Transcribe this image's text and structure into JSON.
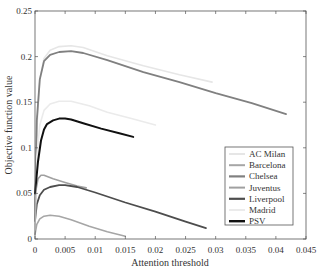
{
  "chart_data": {
    "type": "line",
    "title": "",
    "xlabel": "Attention threshold",
    "ylabel": "Objective function value",
    "xlim": [
      0,
      0.045
    ],
    "ylim": [
      0,
      0.25
    ],
    "xticks": [
      0,
      0.005,
      0.01,
      0.015,
      0.02,
      0.025,
      0.03,
      0.035,
      0.04,
      0.045
    ],
    "xtick_labels": [
      "0",
      "0.005",
      "0.01",
      "0.015",
      "0.02",
      "0.025",
      "0.03",
      "0.035",
      "0.04",
      "0.045"
    ],
    "yticks": [
      0,
      0.05,
      0.1,
      0.15,
      0.2,
      0.25
    ],
    "ytick_labels": [
      "0",
      "0.05",
      "0.1",
      "0.15",
      "0.2",
      "0.25"
    ],
    "grid": false,
    "legend_position": "lower right inside",
    "series": [
      {
        "name": "AC Milan",
        "color": "#e6e6e6",
        "width": 1.6,
        "x": [
          0,
          0.0003,
          0.0008,
          0.0015,
          0.0025,
          0.004,
          0.006,
          0.008,
          0.012,
          0.018,
          0.024,
          0.0294
        ],
        "y": [
          0.01,
          0.12,
          0.175,
          0.198,
          0.207,
          0.211,
          0.212,
          0.21,
          0.201,
          0.19,
          0.18,
          0.172
        ]
      },
      {
        "name": "Barcelona",
        "color": "#a6a6a6",
        "width": 1.6,
        "x": [
          0,
          0.0003,
          0.0008,
          0.0015,
          0.0025,
          0.004,
          0.006,
          0.009,
          0.012,
          0.015
        ],
        "y": [
          0.005,
          0.016,
          0.022,
          0.025,
          0.026,
          0.025,
          0.021,
          0.014,
          0.008,
          0.003
        ]
      },
      {
        "name": "Chelsea",
        "color": "#808080",
        "width": 1.8,
        "x": [
          0,
          0.0003,
          0.0008,
          0.0015,
          0.0025,
          0.004,
          0.006,
          0.008,
          0.012,
          0.018,
          0.024,
          0.03,
          0.036,
          0.0417
        ],
        "y": [
          0.02,
          0.13,
          0.175,
          0.195,
          0.202,
          0.205,
          0.206,
          0.204,
          0.196,
          0.183,
          0.172,
          0.16,
          0.149,
          0.137
        ]
      },
      {
        "name": "Juventus",
        "color": "#a0a0a0",
        "width": 1.6,
        "x": [
          0,
          0.0002,
          0.0005,
          0.001,
          0.0015,
          0.003,
          0.005,
          0.007,
          0.0085
        ],
        "y": [
          0.03,
          0.055,
          0.066,
          0.07,
          0.07,
          0.066,
          0.062,
          0.058,
          0.056
        ]
      },
      {
        "name": "Liverpool",
        "color": "#4d4d4d",
        "width": 1.8,
        "x": [
          0,
          0.0003,
          0.0008,
          0.0015,
          0.0025,
          0.004,
          0.005,
          0.007,
          0.01,
          0.015,
          0.02,
          0.025,
          0.0284
        ],
        "y": [
          0.02,
          0.038,
          0.048,
          0.054,
          0.057,
          0.059,
          0.059,
          0.057,
          0.051,
          0.04,
          0.03,
          0.019,
          0.012
        ]
      },
      {
        "name": "Madrid",
        "color": "#ebebeb",
        "width": 1.6,
        "x": [
          0,
          0.0003,
          0.0008,
          0.0015,
          0.0025,
          0.004,
          0.006,
          0.009,
          0.012,
          0.016,
          0.02
        ],
        "y": [
          0.01,
          0.09,
          0.125,
          0.141,
          0.148,
          0.151,
          0.151,
          0.146,
          0.139,
          0.132,
          0.125
        ]
      },
      {
        "name": "PSV",
        "color": "#111111",
        "width": 2.0,
        "x": [
          0,
          0.0005,
          0.001,
          0.0015,
          0.002,
          0.003,
          0.004,
          0.005,
          0.006,
          0.008,
          0.011,
          0.014,
          0.0163
        ],
        "y": [
          0.05,
          0.085,
          0.108,
          0.12,
          0.126,
          0.13,
          0.132,
          0.132,
          0.131,
          0.127,
          0.121,
          0.116,
          0.112
        ]
      }
    ]
  },
  "legend": {
    "items": [
      "AC Milan",
      "Barcelona",
      "Chelsea",
      "Juventus",
      "Liverpool",
      "Madrid",
      "PSV"
    ]
  }
}
